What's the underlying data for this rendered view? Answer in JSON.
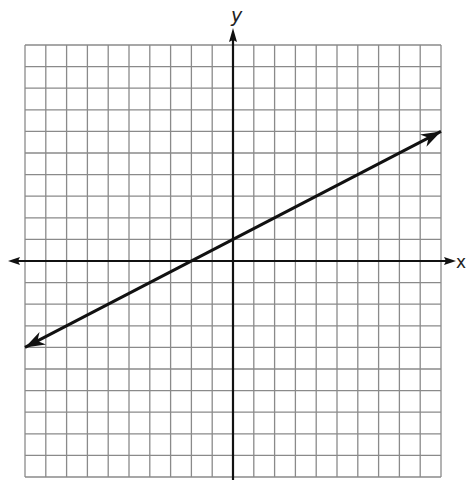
{
  "chart_data": {
    "type": "line",
    "title": "",
    "xlabel": "x",
    "ylabel": "y",
    "xlim": [
      -10,
      10
    ],
    "ylim": [
      -10,
      10
    ],
    "grid": true,
    "grid_step": 1,
    "tick_labels": false,
    "series": [
      {
        "name": "line",
        "equation": "y = 0.5x + 1",
        "slope": 0.5,
        "intercept": 1,
        "x": [
          -10,
          -2,
          0,
          10
        ],
        "y": [
          -4,
          0,
          1,
          6
        ],
        "arrows_both_ends": true
      }
    ]
  },
  "labels": {
    "x_axis": "x",
    "y_axis": "y"
  },
  "colors": {
    "grid": "#8a8a8a",
    "axis": "#111111",
    "line": "#111111",
    "background": "#ffffff"
  }
}
